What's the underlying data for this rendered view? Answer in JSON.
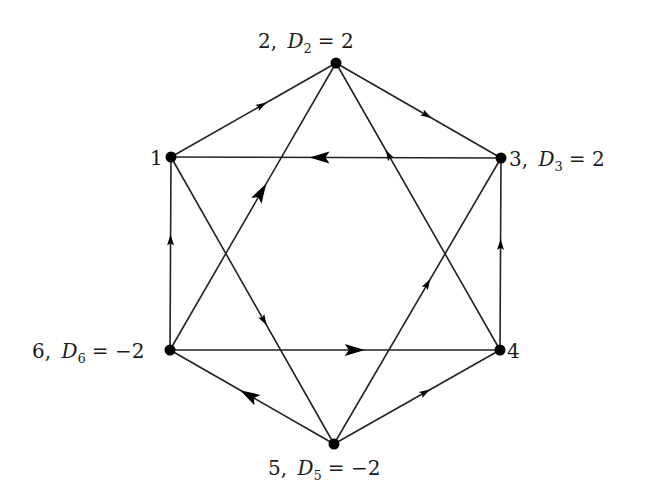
{
  "diagram": {
    "type": "directed-graph",
    "shape": "hexagon-with-star",
    "colors": {
      "line": "#222222",
      "node": "#000000",
      "text": "#1a1a1a",
      "background": "#ffffff"
    },
    "nodes": [
      {
        "id": "1",
        "x": 171,
        "y": 157,
        "label_num": "1",
        "label_D": "",
        "label_sub": "",
        "label_val": ""
      },
      {
        "id": "2",
        "x": 336,
        "y": 63,
        "label_num": "2,",
        "label_D": "D",
        "label_sub": "2",
        "label_val": "= 2"
      },
      {
        "id": "3",
        "x": 501,
        "y": 158,
        "label_num": "3,",
        "label_D": "D",
        "label_sub": "3",
        "label_val": "= 2"
      },
      {
        "id": "4",
        "x": 500,
        "y": 350,
        "label_num": "4",
        "label_D": "",
        "label_sub": "",
        "label_val": ""
      },
      {
        "id": "5",
        "x": 334,
        "y": 444,
        "label_num": "5,",
        "label_D": "D",
        "label_sub": "5",
        "label_val": "= −2"
      },
      {
        "id": "6",
        "x": 170,
        "y": 350,
        "label_num": "6,",
        "label_D": "D",
        "label_sub": "6",
        "label_val": "= −2"
      }
    ],
    "edges": [
      {
        "from": "1",
        "to": "2",
        "arrow_t": 0.55,
        "arrow_size": "small"
      },
      {
        "from": "2",
        "to": "3",
        "arrow_t": 0.55,
        "arrow_size": "small"
      },
      {
        "from": "3",
        "to": "1",
        "arrow_t": 0.55,
        "arrow_size": "large"
      },
      {
        "from": "6",
        "to": "2",
        "arrow_t": 0.55,
        "arrow_size": "large"
      },
      {
        "from": "4",
        "to": "2",
        "arrow_t": 0.68,
        "arrow_size": "small"
      },
      {
        "from": "1",
        "to": "5",
        "arrow_t": 0.57,
        "arrow_size": "small"
      },
      {
        "from": "5",
        "to": "3",
        "arrow_t": 0.56,
        "arrow_size": "small"
      },
      {
        "from": "6",
        "to": "1",
        "arrow_t": 0.57,
        "arrow_size": "small"
      },
      {
        "from": "4",
        "to": "3",
        "arrow_t": 0.55,
        "arrow_size": "small"
      },
      {
        "from": "6",
        "to": "4",
        "arrow_t": 0.56,
        "arrow_size": "large"
      },
      {
        "from": "5",
        "to": "6",
        "arrow_t": 0.52,
        "arrow_size": "large"
      },
      {
        "from": "5",
        "to": "4",
        "arrow_t": 0.55,
        "arrow_size": "small"
      }
    ]
  }
}
